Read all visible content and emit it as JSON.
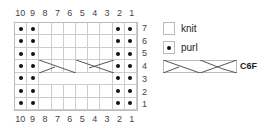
{
  "chart": {
    "columns": [
      "10",
      "9",
      "8",
      "7",
      "6",
      "5",
      "4",
      "3",
      "2",
      "1"
    ],
    "rows": [
      "7",
      "6",
      "5",
      "4",
      "3",
      "2",
      "1"
    ],
    "purl_columns": [
      10,
      9,
      2,
      1
    ],
    "cable_row": 3,
    "cable_columns": "3-8"
  },
  "legend": {
    "knit": "knit",
    "purl": "purl",
    "cable": "C6F"
  }
}
